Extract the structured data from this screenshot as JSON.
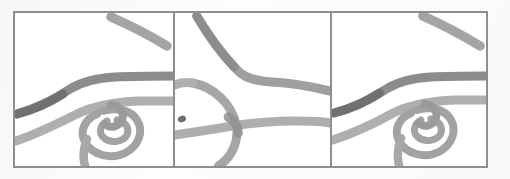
{
  "figure": {
    "title": "Three-panel line sketch comparison",
    "description": "Scanned grayscale figure: three framed panels each containing hand-drawn curved strokes forming a road-like interchange with a loop knot.",
    "frame": {
      "border_color": "#8e8e8e",
      "background_color": "#ffffff",
      "paper_color": "#fdfdfd"
    },
    "stroke_colors": {
      "dark_gray": "#7b7b7b",
      "mid_gray": "#949494",
      "light_gray": "#a8a8a8",
      "pale_gray": "#b9b9b9"
    },
    "panels": [
      {
        "id": "panel-1",
        "label": "",
        "caption": "",
        "elements": [
          {
            "name": "diagonal-stroke-top-right",
            "tone": "mid_gray"
          },
          {
            "name": "upper-horizontal-curve",
            "tone": "dark_gray"
          },
          {
            "name": "lower-horizontal-curve",
            "tone": "light_gray"
          },
          {
            "name": "loop-knot",
            "tone": "light_gray"
          },
          {
            "name": "knot-tail-descending",
            "tone": "light_gray"
          }
        ]
      },
      {
        "id": "panel-2",
        "label": "",
        "caption": "",
        "elements": [
          {
            "name": "descending-bent-stroke",
            "tone": "mid_gray"
          },
          {
            "name": "large-left-arc",
            "tone": "light_gray"
          },
          {
            "name": "lower-horizontal-curve",
            "tone": "light_gray"
          },
          {
            "name": "dot-mark",
            "tone": "dark_gray"
          },
          {
            "name": "arc-tail-descending",
            "tone": "light_gray"
          }
        ]
      },
      {
        "id": "panel-3",
        "label": "",
        "caption": "",
        "elements": [
          {
            "name": "diagonal-stroke-top-right",
            "tone": "mid_gray"
          },
          {
            "name": "upper-horizontal-curve",
            "tone": "dark_gray"
          },
          {
            "name": "lower-horizontal-curve",
            "tone": "light_gray"
          },
          {
            "name": "loop-knot",
            "tone": "light_gray"
          },
          {
            "name": "knot-tail-descending",
            "tone": "light_gray"
          }
        ]
      }
    ]
  }
}
